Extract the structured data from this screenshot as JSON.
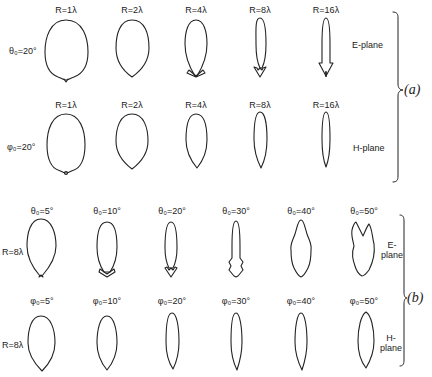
{
  "figure": {
    "part_a": {
      "label": "(a)",
      "e_plane": {
        "row_label": "θ₀=20°",
        "plane_label": "E-plane",
        "patterns": [
          {
            "label": "R=1λ",
            "cx": 66
          },
          {
            "label": "R=2λ",
            "cx": 132
          },
          {
            "label": "R=4λ",
            "cx": 196
          },
          {
            "label": "R=8λ",
            "cx": 260
          },
          {
            "label": "R=16λ",
            "cx": 326
          }
        ]
      },
      "h_plane": {
        "row_label": "φ₀=20°",
        "plane_label": "H-plane",
        "patterns": [
          {
            "label": "R=1λ",
            "cx": 66
          },
          {
            "label": "R=2λ",
            "cx": 132
          },
          {
            "label": "R=4λ",
            "cx": 196
          },
          {
            "label": "R=8λ",
            "cx": 260
          },
          {
            "label": "R=16λ",
            "cx": 326
          }
        ]
      }
    },
    "part_b": {
      "label": "(b)",
      "e_plane": {
        "row_label": "R=8λ",
        "plane_label_line1": "E-",
        "plane_label_line2": "plane",
        "patterns": [
          {
            "label": "θ₀=5°",
            "cx": 41
          },
          {
            "label": "θ₀=10°",
            "cx": 107
          },
          {
            "label": "θ₀=20°",
            "cx": 171
          },
          {
            "label": "θ₀=30°",
            "cx": 236
          },
          {
            "label": "θ₀=40°",
            "cx": 301
          },
          {
            "label": "θ₀=50°",
            "cx": 363
          }
        ]
      },
      "h_plane": {
        "row_label": "R=8λ",
        "plane_label_line1": "H-",
        "plane_label_line2": "plane",
        "patterns": [
          {
            "label": "φ₀=5°",
            "cx": 41
          },
          {
            "label": "φ₀=10°",
            "cx": 107
          },
          {
            "label": "φ₀=20°",
            "cx": 171
          },
          {
            "label": "φ₀=30°",
            "cx": 236
          },
          {
            "label": "φ₀=40°",
            "cx": 301
          },
          {
            "label": "φ₀=50°",
            "cx": 363
          }
        ]
      }
    }
  }
}
